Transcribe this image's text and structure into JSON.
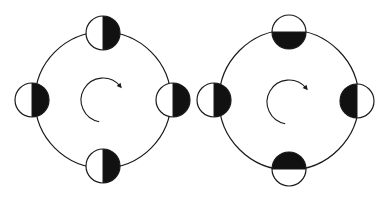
{
  "colors": {
    "background": "#ffffff",
    "stroke": "#1a1a1a",
    "fill_dark": "#111111",
    "fill_light": "#ffffff"
  },
  "diagrams": [
    {
      "id": "left",
      "description": "Orbit with four bodies; dark half always faces the same direction (right)",
      "orbit": {
        "cx": 103,
        "cy": 100,
        "r": 68
      },
      "rotation_arrow": {
        "cx": 103,
        "cy": 100,
        "r": 22,
        "direction": "clockwise"
      },
      "bodies": [
        {
          "position": "top",
          "cx": 103,
          "cy": 33,
          "r": 17,
          "dark_side": "right"
        },
        {
          "position": "left",
          "cx": 32,
          "cy": 100,
          "r": 17,
          "dark_side": "right"
        },
        {
          "position": "right",
          "cx": 173,
          "cy": 100,
          "r": 17,
          "dark_side": "right"
        },
        {
          "position": "bottom",
          "cx": 103,
          "cy": 166,
          "r": 17,
          "dark_side": "right"
        }
      ]
    },
    {
      "id": "right",
      "description": "Orbit with four bodies; dark half always faces the orbit center",
      "orbit": {
        "cx": 289,
        "cy": 100,
        "r": 70
      },
      "rotation_arrow": {
        "cx": 289,
        "cy": 102,
        "r": 22,
        "direction": "clockwise"
      },
      "bodies": [
        {
          "position": "top",
          "cx": 289,
          "cy": 32,
          "r": 17,
          "dark_side": "bottom"
        },
        {
          "position": "left",
          "cx": 214,
          "cy": 100,
          "r": 17,
          "dark_side": "right"
        },
        {
          "position": "right",
          "cx": 357,
          "cy": 101,
          "r": 17,
          "dark_side": "left"
        },
        {
          "position": "bottom",
          "cx": 289,
          "cy": 169,
          "r": 17,
          "dark_side": "top"
        }
      ]
    }
  ]
}
